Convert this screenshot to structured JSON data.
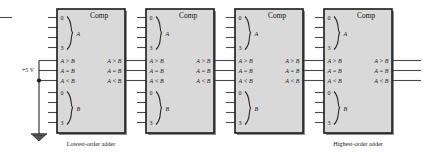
{
  "diagram": {
    "title_label": "Comp",
    "power_label": "+5 V",
    "ground_icon": "ground-icon",
    "group_a_label": "A",
    "group_b_label": "B",
    "bus_first": "0",
    "bus_last": "3",
    "compare_labels": [
      "A > B",
      "A = B",
      "A < B"
    ],
    "captions": {
      "lowest": "Lowest-order adder",
      "highest": "Highest-order adder"
    },
    "colors": {
      "box_fill": "#d9d9d9",
      "box_stroke": "#1a1a1a",
      "wire": "#4a4a4a",
      "text": "#1b1b1b"
    },
    "stages": [
      {
        "name": "stage-1",
        "caption": "Lowest-order adder"
      },
      {
        "name": "stage-2",
        "caption": ""
      },
      {
        "name": "stage-3",
        "caption": ""
      },
      {
        "name": "stage-4",
        "caption": "Highest-order adder"
      }
    ]
  }
}
